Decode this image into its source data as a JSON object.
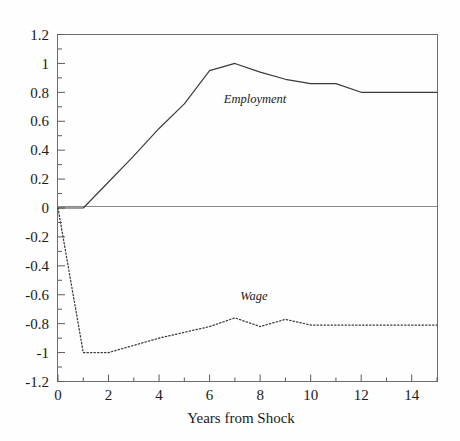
{
  "chart_data": {
    "type": "line",
    "title": "",
    "xlabel": "Years from Shock",
    "ylabel": "",
    "xlim": [
      0,
      15
    ],
    "ylim": [
      -1.2,
      1.2
    ],
    "grid": false,
    "legend_position": "inline-annotation",
    "x": [
      0,
      1,
      2,
      3,
      4,
      5,
      6,
      7,
      8,
      9,
      10,
      11,
      12,
      13,
      14,
      15
    ],
    "xticks": [
      "0",
      "2",
      "4",
      "6",
      "8",
      "10",
      "12",
      "14"
    ],
    "xtick_values": [
      0,
      2,
      4,
      6,
      8,
      10,
      12,
      14
    ],
    "yticks": [
      "1.2",
      "1",
      "0.8",
      "0.6",
      "0.4",
      "0.2",
      "0",
      "-0.2",
      "-0.4",
      "-0.6",
      "-0.8",
      "-1",
      "-1.2"
    ],
    "ytick_values": [
      1.2,
      1,
      0.8,
      0.6,
      0.4,
      0.2,
      0,
      -0.2,
      -0.4,
      -0.6,
      -0.8,
      -1,
      -1.2
    ],
    "series": [
      {
        "name": "Employment",
        "style": "solid",
        "color": "#3a3a3a",
        "annotation_label": "Employment",
        "values": [
          0,
          0,
          0.18,
          0.36,
          0.55,
          0.72,
          0.95,
          1.0,
          0.94,
          0.89,
          0.86,
          0.86,
          0.8,
          0.8,
          0.8,
          0.8
        ]
      },
      {
        "name": "Wage",
        "style": "dotted",
        "color": "#3a3a3a",
        "annotation_label": "Wage",
        "values": [
          0,
          -1.0,
          -1.0,
          -0.95,
          -0.9,
          -0.86,
          -0.82,
          -0.76,
          -0.82,
          -0.77,
          -0.81,
          -0.81,
          -0.81,
          -0.81,
          -0.81,
          -0.81
        ]
      }
    ]
  },
  "annotations": {
    "employment_label": "Employment",
    "wage_label": "Wage"
  },
  "axis": {
    "x_title": "Years from Shock"
  }
}
